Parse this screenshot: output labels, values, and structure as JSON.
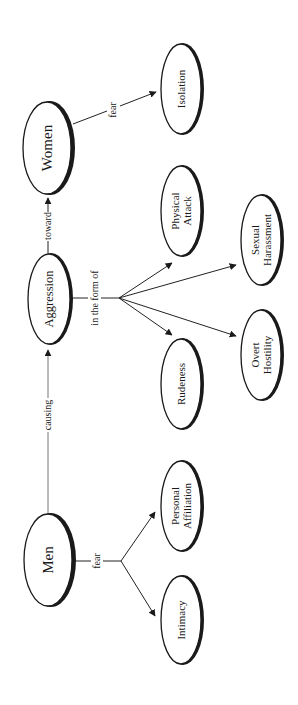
{
  "diagram": {
    "orientation": "rotated -90 degrees (text reads bottom-to-top)",
    "nodes": {
      "men": {
        "label": "Men"
      },
      "aggression": {
        "label": "Aggression"
      },
      "women": {
        "label": "Women"
      },
      "isolation": {
        "label": "Isolation"
      },
      "physical_attack": {
        "line1": "Physical",
        "line2": "Attack"
      },
      "sexual_harassment": {
        "line1": "Sexual",
        "line2": "Harassment"
      },
      "overt_hostility": {
        "line1": "Overt",
        "line2": "Hostility"
      },
      "rudeness": {
        "label": "Rudeness"
      },
      "personal_affiliation": {
        "line1": "Personal",
        "line2": "Affiliation"
      },
      "intimacy": {
        "label": "Intimacy"
      }
    },
    "edges": {
      "men_aggression": {
        "label": "causing"
      },
      "aggression_women": {
        "label": "toward"
      },
      "women_isolation": {
        "label": "fear"
      },
      "aggression_forms": {
        "label": "in the form of"
      },
      "men_fears": {
        "label": "fear"
      }
    },
    "colors": {
      "ink": "#1a1a1a",
      "background": "#ffffff"
    }
  }
}
